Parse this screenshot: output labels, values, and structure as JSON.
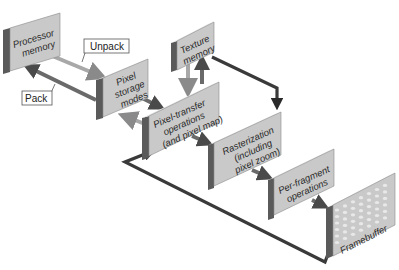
{
  "diagram": {
    "title": "",
    "nodes": {
      "processor_memory": {
        "lines": [
          "Processor",
          "memory"
        ]
      },
      "pixel_storage_modes": {
        "lines": [
          "Pixel",
          "storage",
          "modes"
        ]
      },
      "texture_memory": {
        "lines": [
          "Texture",
          "memory"
        ]
      },
      "pixel_transfer": {
        "lines": [
          "Pixel-transfer",
          "operations",
          "(and pixel map)"
        ]
      },
      "rasterization": {
        "lines": [
          "Rasterization",
          "(including",
          "pixel zoom)"
        ]
      },
      "per_fragment": {
        "lines": [
          "Per-fragment",
          "operations"
        ]
      },
      "framebuffer": {
        "lines": [
          "Framebuffer"
        ]
      }
    },
    "callouts": {
      "unpack": "Unpack",
      "pack": "Pack"
    },
    "edges": [
      {
        "from": "processor_memory",
        "to": "pixel_storage_modes",
        "label": "Unpack"
      },
      {
        "from": "pixel_storage_modes",
        "to": "processor_memory",
        "label": "Pack"
      },
      {
        "from": "pixel_storage_modes",
        "to": "pixel_transfer"
      },
      {
        "from": "pixel_transfer",
        "to": "pixel_storage_modes"
      },
      {
        "from": "texture_memory",
        "to": "pixel_transfer"
      },
      {
        "from": "pixel_transfer",
        "to": "texture_memory"
      },
      {
        "from": "texture_memory",
        "to": "rasterization"
      },
      {
        "from": "pixel_transfer",
        "to": "rasterization"
      },
      {
        "from": "rasterization",
        "to": "per_fragment"
      },
      {
        "from": "per_fragment",
        "to": "framebuffer"
      },
      {
        "from": "framebuffer",
        "to": "pixel_transfer"
      }
    ]
  }
}
